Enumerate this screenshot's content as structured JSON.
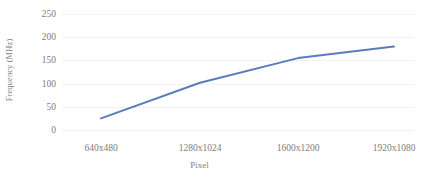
{
  "chart_data": {
    "type": "line",
    "title": "",
    "xlabel": "Pixel",
    "ylabel": "Frequency (MHz)",
    "categories": [
      "640x480",
      "1280x1024",
      "1600x1200",
      "1920x1080"
    ],
    "values": [
      25,
      102,
      155,
      180
    ],
    "series": [
      {
        "name": "Frequency (MHz)",
        "values": [
          25,
          102,
          155,
          180
        ],
        "color": "#5b7cba"
      }
    ],
    "ylim": [
      0,
      250
    ],
    "yticks": [
      0,
      50,
      100,
      150,
      200,
      250
    ],
    "ytick_labels": [
      "0",
      "50",
      "100",
      "150",
      "200",
      "250"
    ],
    "xtick_labels": [
      "640x480",
      "1280x1024",
      "1600x1200",
      "1920x1080"
    ],
    "grid": true,
    "grid_color": "#f2f2f2",
    "legend": false,
    "legend_position": "none",
    "line_color": "#5b7cba",
    "line_width": 2,
    "markers": false,
    "axis_label_color": "#808080",
    "tick_label_color": "#7d7d7d",
    "background": "#ffffff"
  }
}
